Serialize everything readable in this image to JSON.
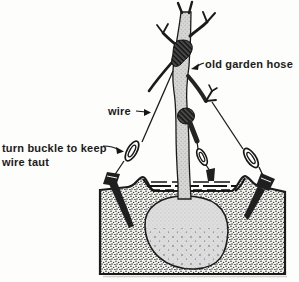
{
  "diagram": {
    "labels": {
      "old_garden_hose": "old garden hose",
      "wire": "wire",
      "turn_buckle_line1": "turn buckle to keep",
      "turn_buckle_line2": "wire taut"
    },
    "colors": {
      "ink": "#1b1b1b",
      "paper": "#fdfdfb",
      "soil_speckle": "#2b2b2b",
      "root_ball_tone": "#dedede",
      "trunk_tone": "#d6d6d4",
      "hose_dark": "#141414"
    }
  }
}
